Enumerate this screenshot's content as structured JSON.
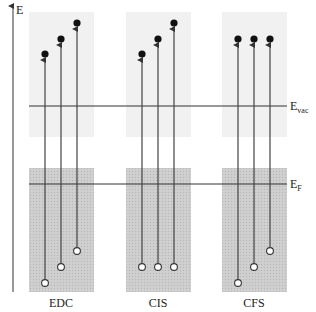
{
  "diagram": {
    "axis": {
      "label": "E"
    },
    "levels": {
      "vacuum": {
        "label": "E",
        "subscript": "vac"
      },
      "fermi": {
        "label": "E",
        "subscript": "F"
      }
    },
    "colors": {
      "vacuum_region": "#f1f1f1",
      "occupied_region": "#cfcfcf",
      "line": "#333333",
      "electron_filled": "#111111",
      "hole_open": "#ffffff"
    },
    "panels": [
      {
        "id": "edc",
        "label": "EDC",
        "description": "Energy distribution curve: fixed photon energy, initial and final states shift together",
        "transitions": [
          {
            "initial": "lowest",
            "final": "lowest"
          },
          {
            "initial": "middle",
            "final": "middle"
          },
          {
            "initial": "highest",
            "final": "highest"
          }
        ]
      },
      {
        "id": "cis",
        "label": "CIS",
        "description": "Constant initial state: fixed initial state, final state varies",
        "transitions": [
          {
            "initial": "middle",
            "final": "lowest"
          },
          {
            "initial": "middle",
            "final": "middle"
          },
          {
            "initial": "middle",
            "final": "highest"
          }
        ]
      },
      {
        "id": "cfs",
        "label": "CFS",
        "description": "Constant final state: initial state varies, fixed final state",
        "transitions": [
          {
            "initial": "lowest",
            "final": "middle"
          },
          {
            "initial": "middle",
            "final": "middle"
          },
          {
            "initial": "highest",
            "final": "middle"
          }
        ]
      }
    ]
  }
}
